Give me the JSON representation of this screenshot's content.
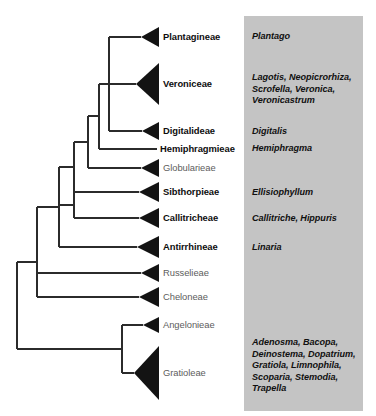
{
  "figure": {
    "type": "cladogram",
    "title": "",
    "orientation": "left-to-right",
    "width": 376,
    "height": 416,
    "background_color": "#ffffff",
    "branch_color": "#2b2b2b",
    "clade_triangle_color": "#131313",
    "genus_panel_color": "#c4c4c4"
  },
  "genus_panel": {
    "x": 244,
    "y": 16,
    "width": 119,
    "height": 395
  },
  "chart_data": {
    "type": "table",
    "title": "",
    "columns": [
      "Tribe",
      "Genera"
    ],
    "rows": [
      [
        "Plantagineae",
        "Plantago"
      ],
      [
        "Veroniceae",
        "Lagotis, Neopicrorhiza, Scrofella, Veronica, Veronicastrum"
      ],
      [
        "Digitalideae",
        "Digitalis"
      ],
      [
        "Hemiphragmieae",
        "Hemiphragma"
      ],
      [
        "Globularieae",
        ""
      ],
      [
        "Sibthorpieae",
        "Ellisiophyllum"
      ],
      [
        "Callitricheae",
        "Callitriche, Hippuris"
      ],
      [
        "Antirrhineae",
        "Linaria"
      ],
      [
        "Russelieae",
        ""
      ],
      [
        "Cheloneae",
        ""
      ],
      [
        "Angelonieae",
        ""
      ],
      [
        "Gratioleae",
        "Adenosma, Bacopa, Deinostema, Dopatrium, Gratiola, Limnophila, Scoparia, Stemodia, Trapella"
      ]
    ]
  },
  "tips": [
    {
      "id": "plantagineae",
      "label": "Plantagineae",
      "y": 37,
      "label_x": 163,
      "emphasis": "bold",
      "clade": true,
      "triangle": {
        "apex_x": 141,
        "base_x": 159,
        "half_height": 10
      },
      "branch_from_x": 109
    },
    {
      "id": "veroniceae",
      "label": "Veroniceae",
      "y": 84,
      "label_x": 163,
      "emphasis": "bold",
      "clade": true,
      "triangle": {
        "apex_x": 136,
        "base_x": 159,
        "half_height": 21
      },
      "branch_from_x": 109
    },
    {
      "id": "digitalideae",
      "label": "Digitalideae",
      "y": 131,
      "label_x": 163,
      "emphasis": "bold",
      "clade": true,
      "triangle": {
        "apex_x": 142,
        "base_x": 159,
        "half_height": 9
      },
      "branch_from_x": 109
    },
    {
      "id": "hemiphragmieae",
      "label": "Hemiphragmieae",
      "y": 149,
      "label_x": 160,
      "emphasis": "bold",
      "clade": false,
      "triangle": null,
      "branch_from_x": 99
    },
    {
      "id": "globularieae",
      "label": "Globularieae",
      "y": 168,
      "label_x": 163,
      "emphasis": "plain",
      "clade": true,
      "triangle": {
        "apex_x": 141,
        "base_x": 159,
        "half_height": 9
      },
      "branch_from_x": 88
    },
    {
      "id": "sibthorpieae",
      "label": "Sibthorpieae",
      "y": 192,
      "label_x": 163,
      "emphasis": "bold",
      "clade": true,
      "triangle": {
        "apex_x": 139,
        "base_x": 159,
        "half_height": 10
      },
      "branch_from_x": 74
    },
    {
      "id": "callitricheae",
      "label": "Callitricheae",
      "y": 218,
      "label_x": 163,
      "emphasis": "bold",
      "clade": true,
      "triangle": {
        "apex_x": 139,
        "base_x": 159,
        "half_height": 10
      },
      "branch_from_x": 74
    },
    {
      "id": "antirrhineae",
      "label": "Antirrhineae",
      "y": 247,
      "label_x": 163,
      "emphasis": "bold",
      "clade": true,
      "triangle": {
        "apex_x": 137,
        "base_x": 159,
        "half_height": 11
      },
      "branch_from_x": 59
    },
    {
      "id": "russelieae",
      "label": "Russelieae",
      "y": 273,
      "label_x": 163,
      "emphasis": "plain",
      "clade": true,
      "triangle": {
        "apex_x": 141,
        "base_x": 159,
        "half_height": 9
      },
      "branch_from_x": 37
    },
    {
      "id": "cheloneae",
      "label": "Cheloneae",
      "y": 297,
      "label_x": 163,
      "emphasis": "plain",
      "clade": true,
      "triangle": {
        "apex_x": 139,
        "base_x": 159,
        "half_height": 10
      },
      "branch_from_x": 37
    },
    {
      "id": "angelonieae",
      "label": "Angelonieae",
      "y": 325,
      "label_x": 163,
      "emphasis": "plain",
      "clade": true,
      "triangle": {
        "apex_x": 143,
        "base_x": 159,
        "half_height": 8
      },
      "branch_from_x": 122
    },
    {
      "id": "gratioleae",
      "label": "Gratioleae",
      "y": 373,
      "label_x": 163,
      "emphasis": "plain",
      "clade": true,
      "triangle": {
        "apex_x": 134,
        "base_x": 159,
        "half_height": 27
      },
      "branch_from_x": 122
    }
  ],
  "nodes": [
    {
      "id": "node-plantagineae-veroniceae-digitalideae",
      "x": 109,
      "y_top": 37,
      "y_bottom": 131,
      "parent_x": 99,
      "parent_y": 84
    },
    {
      "id": "node-hemiphragmieae-clade",
      "x": 99,
      "y_top": 84,
      "y_bottom": 149,
      "parent_x": 88,
      "parent_y": 116
    },
    {
      "id": "node-globularieae-clade",
      "x": 88,
      "y_top": 116,
      "y_bottom": 168,
      "parent_x": 74,
      "parent_y": 142
    },
    {
      "id": "node-sibthorpieae-clade",
      "x": 74,
      "y_top": 142,
      "y_bottom": 192,
      "parent_x": 59,
      "parent_y": 167
    },
    {
      "id": "node-callitricheae-clade",
      "x": 74,
      "y_top": 192,
      "y_bottom": 218,
      "parent_x": 59,
      "parent_y": 205
    },
    {
      "id": "node-upper-core",
      "x": 59,
      "y_top": 167,
      "y_bottom": 247,
      "parent_x": 37,
      "parent_y": 207
    },
    {
      "id": "node-russelieae-cheloneae",
      "x": 37,
      "y_top": 207,
      "y_bottom": 297,
      "parent_x": 17,
      "parent_y": 262
    },
    {
      "id": "node-gratioleae-clade",
      "x": 122,
      "y_top": 325,
      "y_bottom": 373,
      "parent_x": 17,
      "parent_y": 349
    },
    {
      "id": "node-root",
      "x": 17,
      "y_top": 262,
      "y_bottom": 349,
      "parent_x": null,
      "parent_y": null
    }
  ],
  "genus_blocks": [
    {
      "id": "genus-plantago",
      "text": "Plantago",
      "x": 252,
      "y": 31
    },
    {
      "id": "genus-veroniceae",
      "text": "Lagotis, Neopicrorhiza,\nScrofella, Veronica,\nVeronicastrum",
      "x": 252,
      "y": 72
    },
    {
      "id": "genus-digitalis",
      "text": "Digitalis",
      "x": 252,
      "y": 126
    },
    {
      "id": "genus-hemiphragma",
      "text": "Hemiphragma",
      "x": 252,
      "y": 143
    },
    {
      "id": "genus-ellisiophyllum",
      "text": "Ellisiophyllum",
      "x": 252,
      "y": 187
    },
    {
      "id": "genus-callitriche-hippuris",
      "text": "Callitriche, Hippuris",
      "x": 252,
      "y": 213
    },
    {
      "id": "genus-linaria",
      "text": "Linaria",
      "x": 252,
      "y": 242
    },
    {
      "id": "genus-gratioleae",
      "text": "Adenosma, Bacopa,\nDeinostema, Dopatrium,\nGratiola, Limnophila,\nScoparia, Stemodia,\nTrapella",
      "x": 252,
      "y": 337
    }
  ]
}
